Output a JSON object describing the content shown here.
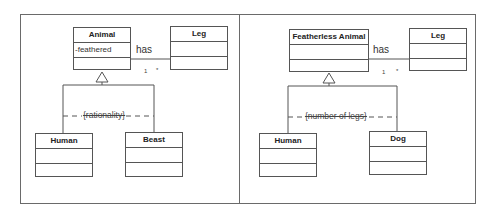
{
  "left_panel": {
    "superclass": {
      "name": "Animal",
      "attributes": [
        "-feathered"
      ]
    },
    "associated_class": {
      "name": "Leg"
    },
    "association": {
      "label": "has",
      "multiplicity_source": "1",
      "multiplicity_target": "*"
    },
    "generalization_set": {
      "constraint": "{rationality}"
    },
    "subclasses": [
      {
        "name": "Human"
      },
      {
        "name": "Beast"
      }
    ]
  },
  "right_panel": {
    "superclass": {
      "name": "Featherless Animal",
      "attributes": []
    },
    "associated_class": {
      "name": "Leg"
    },
    "association": {
      "label": "has",
      "multiplicity_source": "1",
      "multiplicity_target": "*"
    },
    "generalization_set": {
      "constraint": "{number of legs}"
    },
    "subclasses": [
      {
        "name": "Human"
      },
      {
        "name": "Dog"
      }
    ]
  },
  "colors": {
    "line": "#555555",
    "frame": "#6a6a6a",
    "background": "#ffffff"
  }
}
